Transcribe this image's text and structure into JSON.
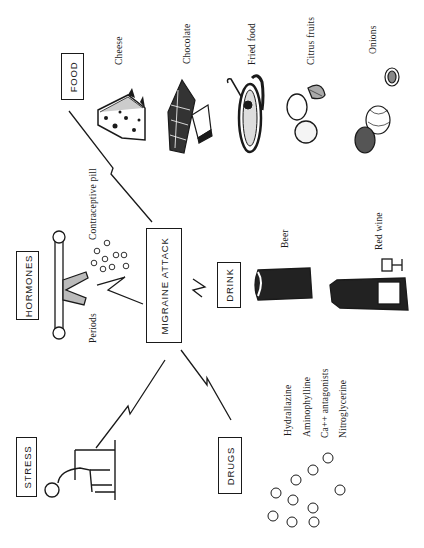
{
  "diagram": {
    "title": "MIGRAINE ATTACK",
    "categories": {
      "food": {
        "label": "FOOD",
        "items": [
          "Cheese",
          "Chocolate",
          "Fried food",
          "Citrus fruits",
          "Onions"
        ]
      },
      "hormones": {
        "label": "HORMONES",
        "items": [
          "Contraceptive pill",
          "Periods"
        ]
      },
      "drink": {
        "label": "DRINK",
        "items": [
          "Beer",
          "Red wine"
        ]
      },
      "stress": {
        "label": "STRESS"
      },
      "drugs": {
        "label": "DRUGS",
        "items": [
          "Hydrallazine",
          "Aminophylline",
          "Ca++ antagonists",
          "Nitroglycerine"
        ]
      }
    },
    "colors": {
      "ink": "#1a1a1a",
      "background": "#ffffff"
    },
    "orientation": "rotated -90deg"
  }
}
